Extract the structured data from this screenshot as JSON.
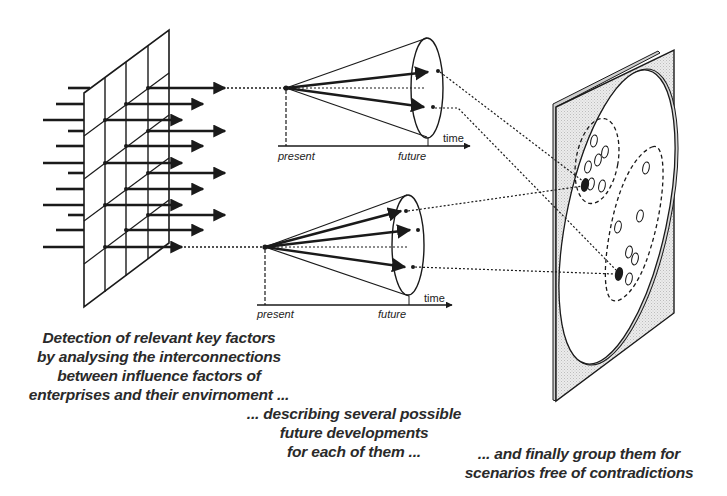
{
  "diagram": {
    "type": "process-flow",
    "stages": [
      {
        "id": "key-factors",
        "shape": "grid-panel-with-arrows",
        "caption_lines": [
          "Detection of relevant key factors",
          "by analysing the interconnections",
          "between influence factors of",
          "enterprises and their envirnoment ..."
        ]
      },
      {
        "id": "future-developments",
        "shape": "projection-cones",
        "cones": [
          {
            "axis_start_label": "present",
            "axis_end_label": "future",
            "axis_arrow_label": "time",
            "arrow_count": 2
          },
          {
            "axis_start_label": "present",
            "axis_end_label": "future",
            "axis_arrow_label": "time",
            "arrow_count": 3
          }
        ],
        "caption_lines": [
          "... describing several possible",
          "future developments",
          "for each of them ..."
        ]
      },
      {
        "id": "scenario-grouping",
        "shape": "tilted-plate-with-clusters",
        "clusters": [
          {
            "name": "cluster-upper",
            "hollow_points": 7,
            "filled_points": 1
          },
          {
            "name": "cluster-lower",
            "hollow_points": 7,
            "filled_points": 1
          }
        ],
        "caption_lines": [
          "... and finally group them for",
          "scenarios free of contradictions"
        ]
      }
    ],
    "colors": {
      "ink": "#1a1a1a",
      "text": "#2a2a2a",
      "plate_fill": "#e6e6e6",
      "background": "#ffffff"
    }
  }
}
